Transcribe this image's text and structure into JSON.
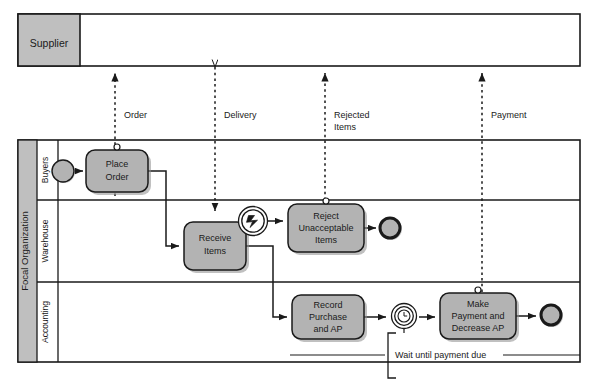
{
  "diagram": {
    "type": "bpmn-collaboration-diagram",
    "colors": {
      "pool_header_fill": "#bfbfbf",
      "lane_header_fill": "#ffffff",
      "task_fill": "#b3b3b3",
      "event_fill": "#b3b3b3",
      "stroke": "#1a1a1a",
      "background": "#ffffff",
      "shadow": "#8c8c8c"
    }
  },
  "pools": [
    {
      "id": "supplier",
      "label": "Supplier",
      "collapsed": true,
      "x": 18,
      "y": 14,
      "width": 562,
      "height": 52,
      "header_width": 62
    },
    {
      "id": "focal",
      "label": "Focal Organization",
      "collapsed": false,
      "x": 18,
      "y": 140,
      "width": 562,
      "height": 222,
      "header_width": 18,
      "lanes": [
        {
          "id": "buyers",
          "label": "Buyers",
          "y": 140,
          "height": 60
        },
        {
          "id": "warehouse",
          "label": "Warehouse",
          "y": 200,
          "height": 82
        },
        {
          "id": "accounting",
          "label": "Accounting",
          "y": 282,
          "height": 80
        }
      ],
      "lane_header_width": 20
    }
  ],
  "tasks": [
    {
      "id": "place-order",
      "label": "Place\nOrder",
      "lane": "buyers",
      "x": 86,
      "y": 150,
      "width": 62,
      "height": 42,
      "marker": "message-send"
    },
    {
      "id": "receive-items",
      "label": "Receive\nItems",
      "lane": "warehouse",
      "x": 184,
      "y": 222,
      "width": 62,
      "height": 48,
      "marker": "none"
    },
    {
      "id": "reject-items",
      "label": "Reject\nUnacceptable\nItems",
      "lane": "warehouse",
      "x": 288,
      "y": 204,
      "width": 76,
      "height": 48,
      "marker": "message-send"
    },
    {
      "id": "record-purchase",
      "label": "Record\nPurchase\nand AP",
      "lane": "accounting",
      "x": 292,
      "y": 295,
      "width": 72,
      "height": 44,
      "marker": "none"
    },
    {
      "id": "make-payment",
      "label": "Make\nPayment and\nDecrease AP",
      "lane": "accounting",
      "x": 440,
      "y": 293,
      "width": 76,
      "height": 46,
      "marker": "message-send"
    }
  ],
  "events": [
    {
      "id": "start-buyers",
      "kind": "start",
      "lane": "buyers",
      "cx": 63,
      "cy": 171,
      "r": 11
    },
    {
      "id": "error-boundary",
      "kind": "intermediate-error",
      "lane": "warehouse",
      "cx": 253,
      "cy": 221,
      "r": 15
    },
    {
      "id": "end-reject",
      "kind": "end",
      "lane": "warehouse",
      "cx": 390,
      "cy": 228,
      "r": 11
    },
    {
      "id": "timer-payment-due",
      "kind": "intermediate-timer",
      "lane": "accounting",
      "cx": 404,
      "cy": 316,
      "r": 13
    },
    {
      "id": "end-payment",
      "kind": "end",
      "lane": "accounting",
      "cx": 551,
      "cy": 315,
      "r": 11
    }
  ],
  "message_flows": [
    {
      "id": "order-flow",
      "label": "Order",
      "x": 115,
      "direction": "up",
      "from_y": 196,
      "to_y": 70
    },
    {
      "id": "delivery-flow",
      "label": "Delivery",
      "x": 215,
      "direction": "down",
      "from_y": 70,
      "to_y": 200
    },
    {
      "id": "rejected-flow",
      "label": "Rejected\nItems",
      "x": 325,
      "direction": "up",
      "from_y": 200,
      "to_y": 70
    },
    {
      "id": "payment-flow",
      "label": "Payment",
      "x": 482,
      "direction": "up",
      "from_y": 290,
      "to_y": 70
    }
  ],
  "message_flow_labels": [
    {
      "id": "label-order",
      "text": "Order",
      "x": 124,
      "y": 120
    },
    {
      "id": "label-delivery",
      "text": "Delivery",
      "x": 224,
      "y": 120
    },
    {
      "id": "label-rejected",
      "text": "Rejected",
      "x": 334,
      "y": 120
    },
    {
      "id": "label-rejected2",
      "text": "Items",
      "x": 334,
      "y": 132
    },
    {
      "id": "label-payment",
      "text": "Payment",
      "x": 491,
      "y": 120
    }
  ],
  "annotations": [
    {
      "id": "wait-annotation",
      "text": "Wait until payment due",
      "x": 395,
      "y": 355,
      "bracket_x": 388,
      "bracket_top": 333,
      "bracket_bottom": 378
    }
  ],
  "sequence_flows": [
    {
      "id": "sf-start-place",
      "from": "start-buyers",
      "to": "place-order"
    },
    {
      "id": "sf-place-receive",
      "from": "place-order",
      "to": "receive-items"
    },
    {
      "id": "sf-receive-error",
      "from": "receive-items",
      "to": "error-boundary"
    },
    {
      "id": "sf-error-reject",
      "from": "error-boundary",
      "to": "reject-items"
    },
    {
      "id": "sf-reject-end",
      "from": "reject-items",
      "to": "end-reject"
    },
    {
      "id": "sf-receive-record",
      "from": "receive-items",
      "to": "record-purchase"
    },
    {
      "id": "sf-record-timer",
      "from": "record-purchase",
      "to": "timer-payment-due"
    },
    {
      "id": "sf-timer-payment",
      "from": "timer-payment-due",
      "to": "make-payment"
    },
    {
      "id": "sf-payment-end",
      "from": "make-payment",
      "to": "end-payment"
    }
  ]
}
